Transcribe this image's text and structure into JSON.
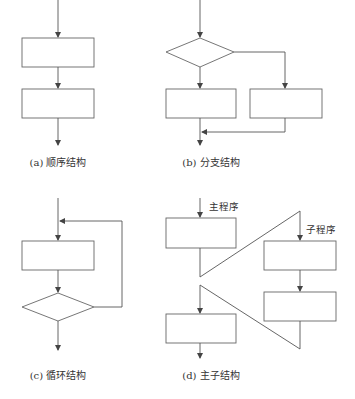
{
  "diagrams": [
    {
      "id": "a",
      "caption": "(a) 顺序结构"
    },
    {
      "id": "b",
      "caption": "(b) 分支结构"
    },
    {
      "id": "c",
      "caption": "(c) 循环结构"
    },
    {
      "id": "d",
      "caption": "(d) 主子结构",
      "labels": {
        "main": "主程序",
        "sub": "子程序"
      }
    }
  ],
  "colors": {
    "line": "#555555",
    "background": "#ffffff"
  }
}
